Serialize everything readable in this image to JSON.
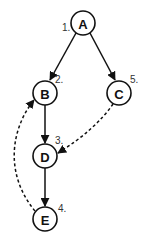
{
  "diagram": {
    "type": "directed-graph",
    "nodes": [
      {
        "id": "A",
        "label": "A",
        "order": "1."
      },
      {
        "id": "B",
        "label": "B",
        "order": "2."
      },
      {
        "id": "C",
        "label": "C",
        "order": "5."
      },
      {
        "id": "D",
        "label": "D",
        "order": "3."
      },
      {
        "id": "E",
        "label": "E",
        "order": "4."
      }
    ],
    "edges": [
      {
        "from": "A",
        "to": "B",
        "style": "solid"
      },
      {
        "from": "A",
        "to": "C",
        "style": "solid"
      },
      {
        "from": "B",
        "to": "D",
        "style": "solid"
      },
      {
        "from": "D",
        "to": "E",
        "style": "solid"
      },
      {
        "from": "C",
        "to": "D",
        "style": "dashed"
      },
      {
        "from": "E",
        "to": "B",
        "style": "dashed"
      }
    ],
    "colors": {
      "stroke": "#111111",
      "order_text": "#333333",
      "background": "#ffffff"
    }
  }
}
